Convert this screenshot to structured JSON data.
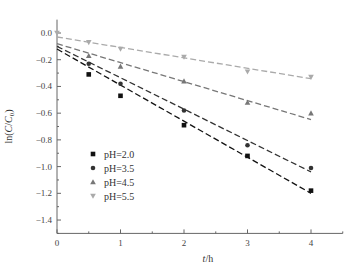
{
  "chart_data": {
    "type": "scatter",
    "title": "",
    "xlabel": "t/h",
    "ylabel": "ln(C/C0)",
    "xlim": [
      0,
      4.5
    ],
    "ylim": [
      -1.5,
      0.1
    ],
    "x_ticks": [
      "0",
      "1",
      "2",
      "3",
      "4"
    ],
    "y_ticks": [
      "0.0",
      "-0.2",
      "-0.4",
      "-0.6",
      "-0.8",
      "-1.0",
      "-1.2",
      "-1.4"
    ],
    "grid": false,
    "legend_position": "lower-left",
    "series": [
      {
        "name": "pH=2.0",
        "marker": "square",
        "color": "#111111",
        "x": [
          0.5,
          1,
          2,
          3,
          4
        ],
        "y": [
          -0.31,
          -0.47,
          -0.69,
          -0.92,
          -1.18
        ],
        "fit": {
          "intercept": -0.12,
          "slope": -0.27
        }
      },
      {
        "name": "pH=3.5",
        "marker": "circle",
        "color": "#333333",
        "x": [
          0.5,
          1,
          2,
          3,
          4
        ],
        "y": [
          -0.23,
          -0.38,
          -0.58,
          -0.84,
          -1.01
        ],
        "fit": {
          "intercept": -0.1,
          "slope": -0.235
        }
      },
      {
        "name": "pH=4.5",
        "marker": "triangle-up",
        "color": "#777777",
        "x": [
          0.5,
          1,
          2,
          3,
          4
        ],
        "y": [
          -0.17,
          -0.25,
          -0.36,
          -0.52,
          -0.6
        ],
        "fit": {
          "intercept": -0.08,
          "slope": -0.142
        }
      },
      {
        "name": "pH=5.5",
        "marker": "triangle-down",
        "color": "#aaaaaa",
        "x": [
          0,
          0.5,
          1,
          2,
          3,
          4
        ],
        "y": [
          0.0,
          -0.07,
          -0.12,
          -0.18,
          -0.29,
          -0.33
        ],
        "fit": {
          "intercept": -0.03,
          "slope": -0.078
        }
      }
    ]
  }
}
